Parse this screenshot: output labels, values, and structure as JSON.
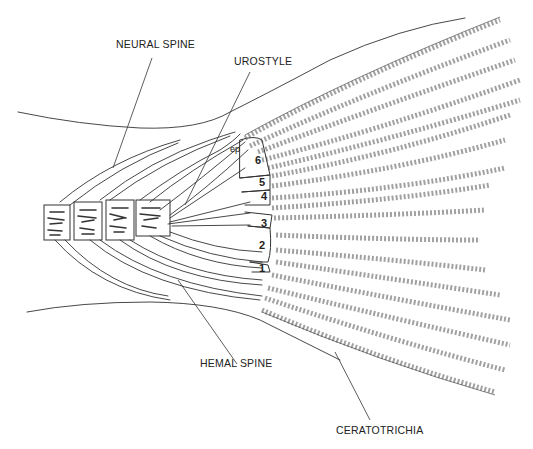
{
  "diagram": {
    "labels": {
      "neural_spine": "NEURAL SPINE",
      "urostyle": "UROSTYLE",
      "hemal_spine": "HEMAL SPINE",
      "ceratotrichia": "CERATOTRICHIA"
    },
    "hypural_numbers": [
      "1",
      "2",
      "3",
      "4",
      "5",
      "6"
    ],
    "epural_abbrev": "ep",
    "colors": {
      "ink": "#333333",
      "background": "#ffffff"
    }
  }
}
